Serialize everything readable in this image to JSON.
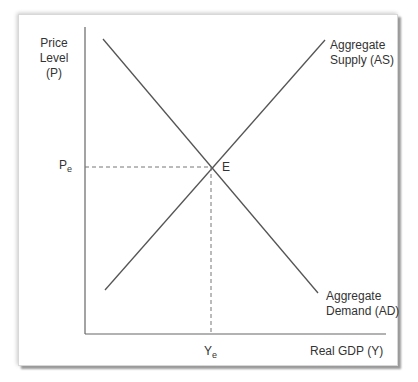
{
  "diagram": {
    "y_axis_label_line1": "Price Level",
    "y_axis_label_line2": "(P)",
    "x_axis_label": "Real GDP (Y)",
    "supply_label_line1": "Aggregate",
    "supply_label_line2": "Supply (AS)",
    "demand_label_line1": "Aggregate",
    "demand_label_line2": "Demand (AD)",
    "equilibrium_label": "E",
    "price_eq_main": "P",
    "price_eq_sub": "e",
    "output_eq_main": "Y",
    "output_eq_sub": "e",
    "line_color": "#555555",
    "dash_color": "#777777"
  }
}
